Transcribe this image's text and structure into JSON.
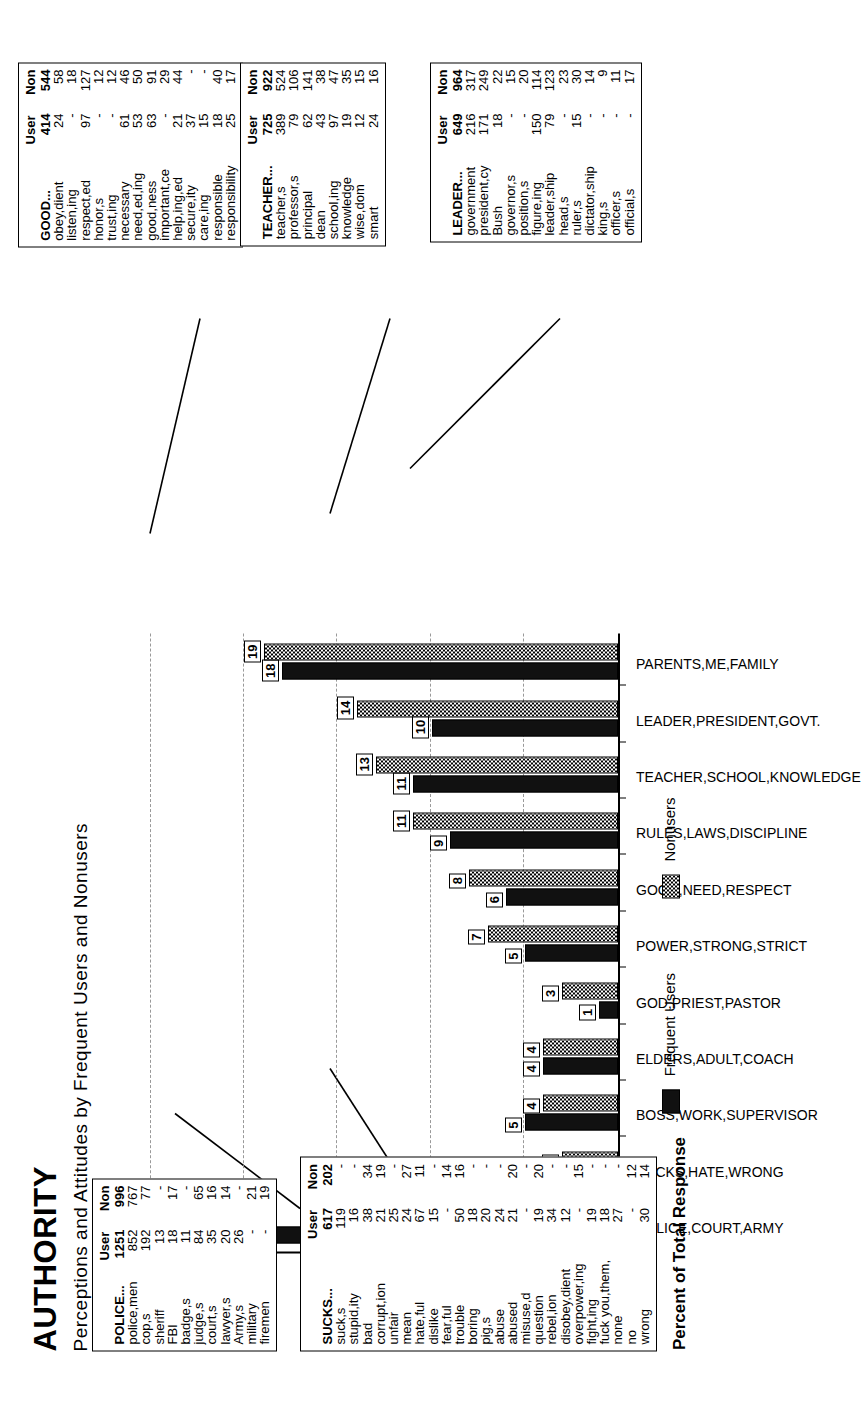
{
  "header": {
    "title": "AUTHORITY",
    "subtitle": "Perceptions and Attitudes by Frequent Users and Nonusers"
  },
  "legend": {
    "users_label": "Frequent Users",
    "nonusers_label": "Nonusers"
  },
  "chart_data": {
    "type": "bar",
    "title": "AUTHORITY",
    "subtitle": "Perceptions and Attitudes by Frequent Users and Nonusers",
    "xlabel": "",
    "ylabel": "Percent of Total Response",
    "ylim": [
      0,
      25
    ],
    "yticks": [
      0,
      5,
      10,
      15,
      20,
      25
    ],
    "grid": true,
    "legend_position": "bottom",
    "categories": [
      "POLICE,COURT,ARMY",
      "SUCKS,HATE,WRONG",
      "BOSS,WORK,SUPERVISOR",
      "ELDERS,ADULT,COACH",
      "GOD,PRIEST,PASTOR",
      "POWER,STRONG,STRICT",
      "GOOD,NEED,RESPECT",
      "RULES,LAWS,DISCIPLINE",
      "TEACHER,SCHOOL,KNOWLEDGE",
      "LEADER,PRESIDENT,GOVT.",
      "PARENTS,ME,FAMILY"
    ],
    "series": [
      {
        "name": "Frequent Users",
        "values": [
          19,
          10,
          5,
          4,
          1,
          5,
          6,
          9,
          11,
          10,
          18
        ]
      },
      {
        "name": "Nonusers",
        "values": [
          14,
          3,
          4,
          4,
          3,
          7,
          8,
          11,
          13,
          14,
          19
        ]
      }
    ]
  },
  "tables": {
    "col_user": "User",
    "col_non": "Non",
    "police": {
      "rows": [
        {
          "label": "POLICE...",
          "user": "1251",
          "non": "996"
        },
        {
          "label": "police,men",
          "user": "852",
          "non": "767"
        },
        {
          "label": "cop,s",
          "user": "192",
          "non": "77"
        },
        {
          "label": "sheriff",
          "user": "13",
          "non": "-"
        },
        {
          "label": "FBI",
          "user": "18",
          "non": "17"
        },
        {
          "label": "badge,s",
          "user": "11",
          "non": "-"
        },
        {
          "label": "judge,s",
          "user": "84",
          "non": "65"
        },
        {
          "label": "court,s",
          "user": "35",
          "non": "16"
        },
        {
          "label": "lawyer,s",
          "user": "20",
          "non": "14"
        },
        {
          "label": "Army,s",
          "user": "26",
          "non": "-"
        },
        {
          "label": "military",
          "user": "-",
          "non": "21"
        },
        {
          "label": "firemen",
          "user": "-",
          "non": "19"
        }
      ]
    },
    "sucks": {
      "rows": [
        {
          "label": "SUCKS...",
          "user": "617",
          "non": "202"
        },
        {
          "label": "suck,s",
          "user": "119",
          "non": "-"
        },
        {
          "label": "stupid,ity",
          "user": "16",
          "non": "-"
        },
        {
          "label": "bad",
          "user": "38",
          "non": "34"
        },
        {
          "label": "corrupt,ion",
          "user": "21",
          "non": "19"
        },
        {
          "label": "unfair",
          "user": "25",
          "non": "-"
        },
        {
          "label": "mean",
          "user": "24",
          "non": "27"
        },
        {
          "label": "hate,ful",
          "user": "67",
          "non": "11"
        },
        {
          "label": "dislike",
          "user": "15",
          "non": "-"
        },
        {
          "label": "fear,ful",
          "user": "-",
          "non": "14"
        },
        {
          "label": "trouble",
          "user": "50",
          "non": "16"
        },
        {
          "label": "boring",
          "user": "18",
          "non": "-"
        },
        {
          "label": "pig,s",
          "user": "20",
          "non": "-"
        },
        {
          "label": "abuse",
          "user": "24",
          "non": "-"
        },
        {
          "label": "abused",
          "user": "21",
          "non": "20"
        },
        {
          "label": "misuse,d",
          "user": "-",
          "non": "-"
        },
        {
          "label": "question",
          "user": "19",
          "non": "20"
        },
        {
          "label": "rebel,ion",
          "user": "34",
          "non": "-"
        },
        {
          "label": "disobey,dient",
          "user": "12",
          "non": "-"
        },
        {
          "label": "overpower,ing",
          "user": "-",
          "non": "15"
        },
        {
          "label": "fight,ing",
          "user": "19",
          "non": "-"
        },
        {
          "label": "fuck you,them,",
          "user": "18",
          "non": "-"
        },
        {
          "label": "none",
          "user": "27",
          "non": "-"
        },
        {
          "label": "no",
          "user": "-",
          "non": "12"
        },
        {
          "label": "wrong",
          "user": "30",
          "non": "14"
        }
      ]
    },
    "good": {
      "rows": [
        {
          "label": "GOOD...",
          "user": "414",
          "non": "544"
        },
        {
          "label": "obey,dient",
          "user": "24",
          "non": "58"
        },
        {
          "label": "listen,ing",
          "user": "-",
          "non": "18"
        },
        {
          "label": "respect,ed",
          "user": "97",
          "non": "127"
        },
        {
          "label": "honor,s",
          "user": "-",
          "non": "12"
        },
        {
          "label": "trust,ing",
          "user": "-",
          "non": "12"
        },
        {
          "label": "necessary",
          "user": "61",
          "non": "46"
        },
        {
          "label": "need,ed,ing",
          "user": "53",
          "non": "50"
        },
        {
          "label": "good,ness",
          "user": "63",
          "non": "91"
        },
        {
          "label": "important,ce",
          "user": "-",
          "non": "29"
        },
        {
          "label": "help,ing,ed",
          "user": "21",
          "non": "44"
        },
        {
          "label": "secure,ity",
          "user": "37",
          "non": "-"
        },
        {
          "label": "care,ing",
          "user": "15",
          "non": "-"
        },
        {
          "label": "responsible",
          "user": "18",
          "non": "40"
        },
        {
          "label": "responsibility",
          "user": "25",
          "non": "17"
        }
      ]
    },
    "teacher": {
      "rows": [
        {
          "label": "TEACHER...",
          "user": "725",
          "non": "922"
        },
        {
          "label": "teacher,s",
          "user": "389",
          "non": "524"
        },
        {
          "label": "professor,s",
          "user": "79",
          "non": "106"
        },
        {
          "label": "principal",
          "user": "62",
          "non": "141"
        },
        {
          "label": "dean",
          "user": "43",
          "non": "38"
        },
        {
          "label": "school,ing",
          "user": "97",
          "non": "47"
        },
        {
          "label": "knowledge",
          "user": "19",
          "non": "35"
        },
        {
          "label": "wise,dom",
          "user": "12",
          "non": "15"
        },
        {
          "label": "smart",
          "user": "24",
          "non": "16"
        }
      ]
    },
    "leader": {
      "rows": [
        {
          "label": "LEADER...",
          "user": "649",
          "non": "964"
        },
        {
          "label": "government",
          "user": "216",
          "non": "317"
        },
        {
          "label": "president,cy",
          "user": "171",
          "non": "249"
        },
        {
          "label": "Bush",
          "user": "18",
          "non": "22"
        },
        {
          "label": "governor,s",
          "user": "-",
          "non": "15"
        },
        {
          "label": "position,s",
          "user": "-",
          "non": "20"
        },
        {
          "label": "figure,ing",
          "user": "150",
          "non": "114"
        },
        {
          "label": "leader,ship",
          "user": "79",
          "non": "123"
        },
        {
          "label": "head,s",
          "user": "-",
          "non": "23"
        },
        {
          "label": "ruler,s",
          "user": "15",
          "non": "30"
        },
        {
          "label": "dictator,ship",
          "user": "-",
          "non": "14"
        },
        {
          "label": "king,s",
          "user": "-",
          "non": "9"
        },
        {
          "label": "officer,s",
          "user": "-",
          "non": "11"
        },
        {
          "label": "official,s",
          "user": "-",
          "non": "17"
        }
      ]
    }
  }
}
